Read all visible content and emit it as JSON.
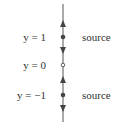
{
  "diagram": {
    "type": "phase-line",
    "equilibria": [
      {
        "label": "y = 1",
        "value": 1,
        "classification": "source",
        "marker": "filled",
        "y_px": 37
      },
      {
        "label": "y = 0",
        "value": 0,
        "classification": "",
        "marker": "open",
        "y_px": 65
      },
      {
        "label": "y = −1",
        "value": -1,
        "classification": "source",
        "marker": "filled",
        "y_px": 95
      }
    ],
    "arrows": [
      {
        "direction": "up",
        "y_px": 24
      },
      {
        "direction": "down",
        "y_px": 50
      },
      {
        "direction": "up",
        "y_px": 80
      },
      {
        "direction": "down",
        "y_px": 109
      }
    ],
    "colors": {
      "line": "#555555",
      "marker": "#444444",
      "text": "#333333"
    }
  }
}
